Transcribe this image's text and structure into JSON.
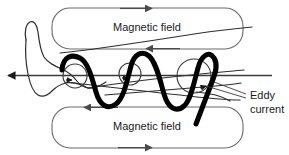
{
  "figure": {
    "width": 289,
    "height": 155,
    "background_color": "#ffffff",
    "title": "",
    "labels": {
      "magnetic_field_top": "Magnetic field",
      "magnetic_field_bottom": "Magnetic field",
      "eddy_current_line1": "Eddy",
      "eddy_current_line2": "current"
    },
    "colors": {
      "coil_stroke": "#000000",
      "outline_stroke": "#3a3a3a",
      "field_loop_stroke": "#6b6b6b",
      "text": "#1a1a1a",
      "background": "#ffffff"
    },
    "field_loops": [
      {
        "name": "top-magnetic-field-loop",
        "label": "Magnetic field",
        "x": 52,
        "y": 8,
        "width": 191,
        "height": 41,
        "corner_radius": 18,
        "top_arrow_direction": "right",
        "bottom_arrow_direction": "left"
      },
      {
        "name": "bottom-magnetic-field-loop",
        "label": "Magnetic field",
        "x": 52,
        "y": 107,
        "width": 191,
        "height": 41,
        "corner_radius": 18,
        "top_arrow_direction": "left",
        "bottom_arrow_direction": "right"
      }
    ],
    "eddy_current_circles": [
      {
        "name": "eddy-current-circle-left",
        "cx": 75,
        "cy": 76,
        "r": 12,
        "arrow_direction": "right"
      },
      {
        "name": "eddy-current-circle-middle",
        "cx": 130,
        "cy": 74,
        "r": 11,
        "arrow_direction": "right"
      },
      {
        "name": "eddy-current-circle-right",
        "cx": 194,
        "cy": 76,
        "r": 17,
        "arrow_direction": "right"
      }
    ],
    "coil": {
      "name": "eddy-current-coil",
      "stroke_width": 5,
      "description": "thick zigzag coil winding"
    },
    "axis_arrow": {
      "name": "axis-arrow",
      "direction": "left",
      "y": 76,
      "x_start": 272,
      "x_end": 4
    }
  }
}
